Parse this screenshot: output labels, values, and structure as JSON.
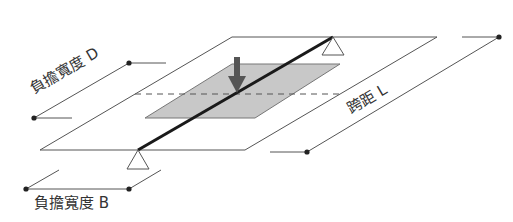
{
  "labels": {
    "load_width_d": "負擔寬度 D",
    "span_l": "跨距 L",
    "load_width_b": "負擔寬度 B"
  },
  "icons": {
    "load_arrow": "down-arrow",
    "support_top": "triangle-support",
    "support_bottom": "triangle-support",
    "dimension_endpoint": "dot"
  },
  "colors": {
    "outline": "#555555",
    "beam": "#1a1a1a",
    "shaded_area": "#c8c8c8",
    "arrow": "#555555",
    "text": "#333333",
    "background": "#ffffff"
  }
}
